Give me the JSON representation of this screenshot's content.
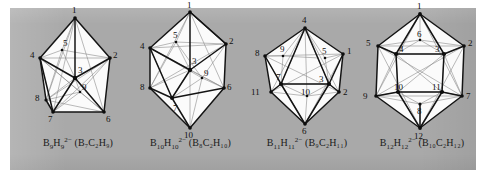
{
  "figure": {
    "background_color": "#ffffff",
    "plate_color": "#a9a9a9",
    "face_color": "#fbfbfb",
    "edge_color": "#141414",
    "hidden_edge_color": "#8c8c8c",
    "label_color": "#111111",
    "panel_count": 4
  },
  "panels": [
    {
      "id": "b9",
      "name": "tricapped-trigonal-prism",
      "vertex_count": 9,
      "caption": {
        "anion_element": "B",
        "anion_sub": "9",
        "hydride_element": "H",
        "hydride_sub": "9",
        "charge": "2−",
        "carborane_open": "(",
        "carborane": "B₇C₂H₉",
        "carborane_close": ")",
        "full_text": "B9H9 2− (B7C2H9)"
      },
      "vertex_labels": [
        "1",
        "2",
        "3",
        "4",
        "5",
        "6",
        "7",
        "8",
        "9"
      ]
    },
    {
      "id": "b10",
      "name": "bicapped-square-antiprism",
      "vertex_count": 10,
      "caption": {
        "anion_element": "B",
        "anion_sub": "10",
        "hydride_element": "H",
        "hydride_sub": "10",
        "charge": "2−",
        "carborane_open": "(",
        "carborane": "B₈C₂H₁₀",
        "carborane_close": ")",
        "full_text": "B10H10 2− (B8C2H10)"
      },
      "vertex_labels": [
        "1",
        "2",
        "3",
        "4",
        "5",
        "6",
        "7",
        "8",
        "9",
        "10"
      ]
    },
    {
      "id": "b11",
      "name": "octadecahedron",
      "vertex_count": 11,
      "caption": {
        "anion_element": "B",
        "anion_sub": "11",
        "hydride_element": "H",
        "hydride_sub": "11",
        "charge": "2−",
        "carborane_open": "(",
        "carborane": "B₉C₂H₁₁",
        "carborane_close": ")",
        "full_text": "B11H11 2− (B9C2H11)"
      },
      "vertex_labels": [
        "1",
        "2",
        "3",
        "4",
        "5",
        "6",
        "7",
        "8",
        "9",
        "10",
        "11"
      ]
    },
    {
      "id": "b12",
      "name": "icosahedron",
      "vertex_count": 12,
      "caption": {
        "anion_element": "B",
        "anion_sub": "12",
        "hydride_element": "H",
        "hydride_sub": "12",
        "charge": "2−",
        "carborane_open": "(",
        "carborane": "B₁₀C₂H₁₂",
        "carborane_close": ")",
        "full_text": "B12H12 2− (B10C2H12)"
      },
      "vertex_labels": [
        "1",
        "2",
        "3",
        "4",
        "5",
        "6",
        "7",
        "8",
        "9",
        "10",
        "11",
        "12"
      ]
    }
  ],
  "vertex_label_text": {
    "b9": {
      "v1": "1",
      "v2": "2",
      "v3": "3",
      "v4": "4",
      "v5": "5",
      "v6": "6",
      "v7": "7",
      "v8": "8",
      "v9": "9"
    },
    "b10": {
      "v1": "1",
      "v2": "2",
      "v3": "3",
      "v4": "4",
      "v5": "5",
      "v6": "6",
      "v7": "7",
      "v8": "8",
      "v9": "9",
      "v10": "10"
    },
    "b11": {
      "v1": "1",
      "v2": "2",
      "v3": "3",
      "v4": "4",
      "v5": "5",
      "v6": "6",
      "v7": "7",
      "v8": "8",
      "v9": "9",
      "v10": "10",
      "v11": "11"
    },
    "b12": {
      "v1": "1",
      "v2": "2",
      "v3": "3",
      "v4": "4",
      "v5": "5",
      "v6": "6",
      "v7": "7",
      "v8": "8",
      "v9": "9",
      "v10": "10",
      "v11": "11",
      "v12": "12"
    }
  }
}
